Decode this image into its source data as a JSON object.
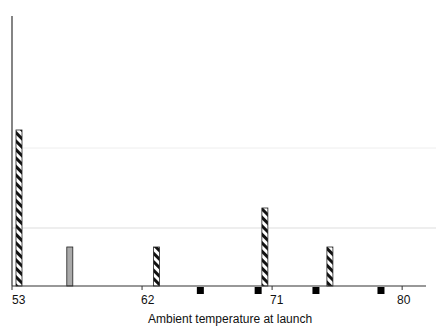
{
  "chart_data": {
    "type": "bar",
    "title": "",
    "xlabel": "Ambient temperature at launch",
    "ylabel": "",
    "x_ticks": [
      53,
      62,
      71,
      80
    ],
    "xlim": [
      53,
      81
    ],
    "grid": true,
    "series": [
      {
        "name": "Hatched bars (above axis)",
        "style": "diagonal-hatch",
        "points": [
          {
            "x": 53,
            "value": 4
          },
          {
            "x": 63,
            "value": 1
          },
          {
            "x": 70.5,
            "value": 2
          },
          {
            "x": 75,
            "value": 1
          }
        ]
      },
      {
        "name": "Gray bar (above axis)",
        "style": "gray",
        "points": [
          {
            "x": 57,
            "value": 1
          }
        ]
      },
      {
        "name": "Black markers (below axis)",
        "style": "black-square",
        "points": [
          {
            "x": 66
          },
          {
            "x": 70
          },
          {
            "x": 74
          },
          {
            "x": 78.5
          }
        ]
      }
    ]
  },
  "axis": {
    "tick_labels": [
      "53",
      "62",
      "71",
      "80"
    ],
    "xlabel": "Ambient temperature at launch"
  },
  "colors": {
    "axis": "#333333",
    "grid": "#dddddd",
    "hatch_dark": "#111111",
    "gray_bar": "#aaaaaa",
    "marker": "#000000"
  }
}
